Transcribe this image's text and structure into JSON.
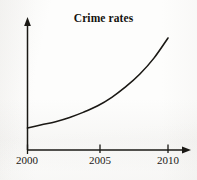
{
  "chart_data": {
    "type": "line",
    "title": "Crime rates",
    "xlabel": "",
    "ylabel": "",
    "x": [
      2000,
      2001,
      2002,
      2003,
      2004,
      2005,
      2006,
      2007,
      2008,
      2009,
      2010
    ],
    "values": [
      10,
      13,
      16,
      20,
      25,
      31,
      39,
      49,
      61,
      76,
      95
    ],
    "series": [
      {
        "name": "Crime rates",
        "values": [
          10,
          13,
          16,
          20,
          25,
          31,
          39,
          49,
          61,
          76,
          95
        ]
      }
    ],
    "xticks": [
      "2000",
      "2005",
      "2010"
    ],
    "xtick_values": [
      2000,
      2005,
      2010
    ],
    "yticks": [],
    "xlim": [
      2000,
      2010
    ],
    "ylim": [
      0,
      110
    ],
    "grid": false,
    "legend": false,
    "legend_position": "none",
    "annotations": [],
    "curve_color": "#1a1814",
    "axis_color": "#1a1814",
    "background_color": "#fdfdfc"
  },
  "axes": {
    "x_axis_name": "x-axis",
    "y_axis_name": "y-axis",
    "x_arrow": "arrow-right",
    "y_arrow": "arrow-up"
  }
}
